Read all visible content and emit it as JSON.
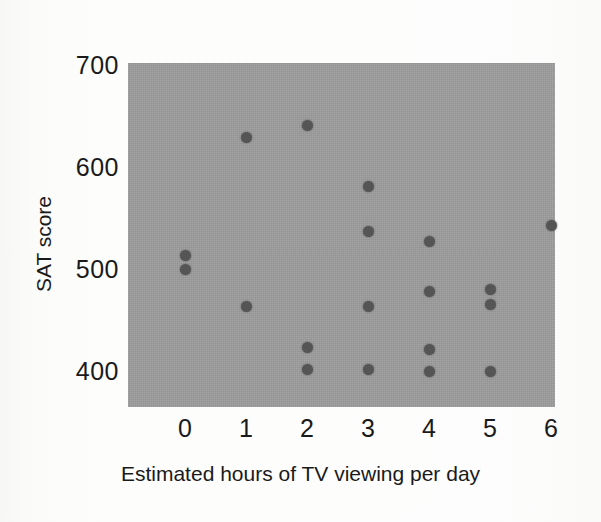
{
  "chart_data": {
    "type": "scatter",
    "title": "",
    "xlabel": "Estimated hours of TV viewing per day",
    "ylabel": "SAT score",
    "xlim": [
      -1.05,
      6.0
    ],
    "ylim": [
      363,
      700
    ],
    "xticks": [
      "0",
      "1",
      "2",
      "3",
      "4",
      "5",
      "6"
    ],
    "xtick_values": [
      0,
      1,
      2,
      3,
      4,
      5,
      6
    ],
    "yticks": [
      "400",
      "500",
      "600",
      "700"
    ],
    "ytick_values": [
      400,
      500,
      600,
      700
    ],
    "grid": false,
    "legend": null,
    "panel_color": "#9d9d9d",
    "marker_color": "#555555",
    "marker_size": 11,
    "points": [
      {
        "x": 0,
        "y": 513
      },
      {
        "x": 0,
        "y": 500
      },
      {
        "x": 1,
        "y": 629
      },
      {
        "x": 1,
        "y": 463
      },
      {
        "x": 2,
        "y": 641
      },
      {
        "x": 2,
        "y": 423
      },
      {
        "x": 2,
        "y": 401
      },
      {
        "x": 3,
        "y": 581
      },
      {
        "x": 3,
        "y": 537
      },
      {
        "x": 3,
        "y": 463
      },
      {
        "x": 3,
        "y": 401
      },
      {
        "x": 4,
        "y": 527
      },
      {
        "x": 4,
        "y": 478
      },
      {
        "x": 4,
        "y": 421
      },
      {
        "x": 4,
        "y": 400
      },
      {
        "x": 5,
        "y": 480
      },
      {
        "x": 5,
        "y": 465
      },
      {
        "x": 5,
        "y": 400
      },
      {
        "x": 6,
        "y": 543
      }
    ]
  }
}
